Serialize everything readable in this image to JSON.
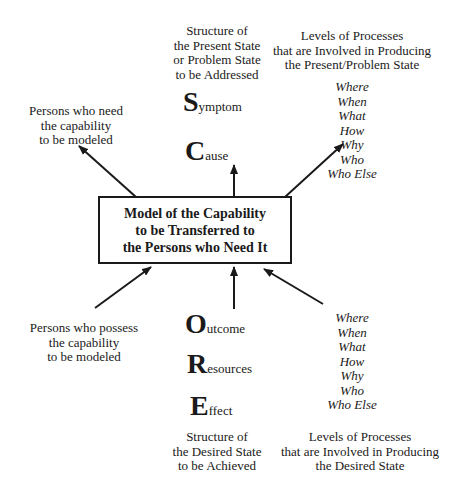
{
  "center_box": {
    "lines": [
      "Model of the Capability",
      "to be Transferred to",
      "the Persons who Need It"
    ]
  },
  "top": {
    "structure_label": [
      "Structure of",
      "the Present State",
      "or Problem State",
      "to be Addressed"
    ],
    "levels_label": [
      "Levels of Processes",
      "that are Involved in Producing",
      "the Present/Problem State"
    ],
    "levels_items": [
      "Where",
      "When",
      "What",
      "How",
      "Why",
      "Who",
      "Who Else"
    ],
    "acronym": [
      {
        "initial": "S",
        "rest": "ymptom"
      },
      {
        "initial": "C",
        "rest": "ause"
      }
    ],
    "persons_label": [
      "Persons who need",
      "the capability",
      "to be modeled"
    ]
  },
  "bottom": {
    "persons_label": [
      "Persons who possess",
      "the capability",
      "to be modeled"
    ],
    "acronym": [
      {
        "initial": "O",
        "rest": "utcome"
      },
      {
        "initial": "R",
        "rest": "esources"
      },
      {
        "initial": "E",
        "rest": "ffect"
      }
    ],
    "levels_items": [
      "Where",
      "When",
      "What",
      "How",
      "Why",
      "Who",
      "Who Else"
    ],
    "structure_label": [
      "Structure of",
      "the Desired State",
      "to be Achieved"
    ],
    "levels_label": [
      "Levels of Processes",
      "that are Involved in Producing",
      "the Desired State"
    ]
  },
  "colors": {
    "ink": "#1a1a1a",
    "background": "#ffffff"
  }
}
